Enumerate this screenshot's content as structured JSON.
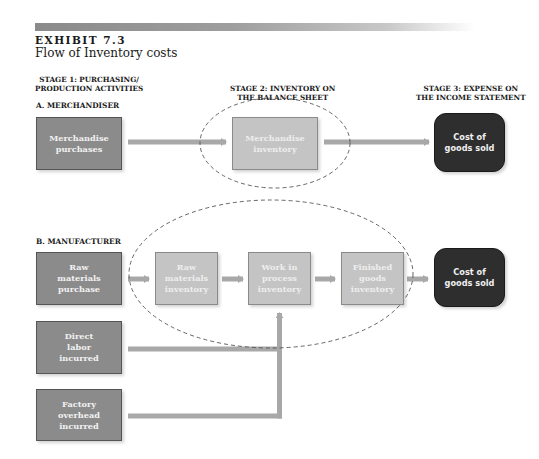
{
  "header": {
    "exhibit_label": "EXHIBIT 7.3",
    "title": "Flow of Inventory costs"
  },
  "stages": {
    "stage1": [
      "STAGE 1: PURCHASING/",
      "PRODUCTION ACTIVITIES"
    ],
    "stage2": [
      "STAGE 2: INVENTORY ON",
      "THE BALANCE SHEET"
    ],
    "stage3": [
      "STAGE 3: EXPENSE ON",
      "THE INCOME STATEMENT"
    ]
  },
  "merchandiser": {
    "section_label": "A. MERCHANDISER",
    "purchases": [
      "Merchandise",
      "purchases"
    ],
    "inventory": [
      "Merchandise",
      "inventory"
    ],
    "cogs": [
      "Cost of",
      "goods sold"
    ]
  },
  "manufacturer": {
    "section_label": "B. MANUFACTURER",
    "raw_purchase": [
      "Raw",
      "materials",
      "purchase"
    ],
    "direct_labor": [
      "Direct",
      "labor",
      "incurred"
    ],
    "factory_overhead": [
      "Factory",
      "overhead",
      "incurred"
    ],
    "raw_inventory": [
      "Raw",
      "materials",
      "inventory"
    ],
    "wip_inventory": [
      "Work in",
      "process",
      "inventory"
    ],
    "fg_inventory": [
      "Finished",
      "goods",
      "inventory"
    ],
    "cogs": [
      "Cost of",
      "goods sold"
    ]
  },
  "colors": {
    "stage1_box": "#8b8b8b",
    "stage2_box": "#c4c4c4",
    "stage3_box": "#2e2e2e",
    "arrow": "#a8a8a8",
    "ellipse_stroke": "#555555"
  }
}
